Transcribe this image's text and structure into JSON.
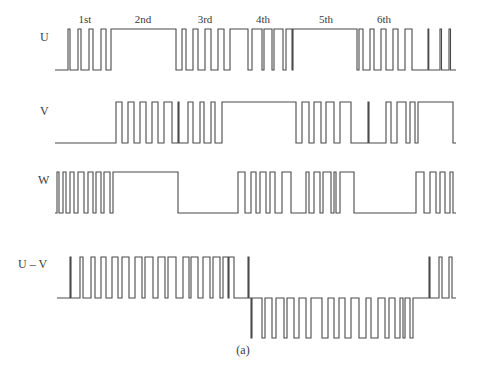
{
  "figure": {
    "caption": "(a)",
    "sectors": [
      {
        "label": "1st",
        "x": 85
      },
      {
        "label": "2nd",
        "x": 143
      },
      {
        "label": "3rd",
        "x": 205
      },
      {
        "label": "4th",
        "x": 263
      },
      {
        "label": "5th",
        "x": 326
      },
      {
        "label": "6th",
        "x": 384
      }
    ],
    "waveforms": [
      {
        "name": "U",
        "label": "U",
        "label_pos": [
          40,
          38
        ],
        "high": 29,
        "low": 70,
        "start": 55,
        "end": 456,
        "initial": "low",
        "edges": [
          68,
          70,
          78,
          81,
          89,
          93,
          101,
          106,
          111,
          176,
          182,
          186,
          193,
          198,
          205,
          211,
          218,
          224,
          230,
          248,
          252,
          262,
          264,
          272,
          274,
          283,
          286,
          292,
          293,
          357,
          359,
          363,
          370,
          374,
          381,
          386,
          393,
          398,
          405,
          412,
          428,
          428.8,
          440,
          441.5,
          449,
          450.5
        ]
      },
      {
        "name": "V",
        "label": "V",
        "label_pos": [
          40,
          112
        ],
        "high": 102,
        "low": 143,
        "start": 55,
        "end": 456,
        "initial": "low",
        "edges": [
          116,
          122,
          128,
          134,
          140,
          146,
          152,
          158,
          164,
          172,
          178,
          179,
          188,
          193,
          200,
          204,
          211,
          215,
          222,
          296,
          302,
          309,
          314,
          321,
          326,
          334,
          340,
          351,
          368,
          369,
          386,
          391,
          397,
          406,
          410,
          415,
          418,
          453
        ]
      },
      {
        "name": "W",
        "label": "W",
        "label_pos": [
          38,
          181
        ],
        "high": 172,
        "low": 213,
        "start": 55,
        "end": 456,
        "initial": "high_pulses",
        "edges": [
          57,
          59,
          63,
          66,
          70,
          74,
          78,
          84,
          88,
          93,
          96,
          101,
          104,
          110,
          113,
          178,
          178,
          178,
          238,
          245,
          251,
          256,
          260,
          266,
          270,
          275,
          282,
          291,
          306,
          309,
          314,
          320,
          323,
          331,
          334,
          336,
          340,
          354,
          355,
          355,
          416,
          424,
          430,
          436,
          440,
          445,
          450,
          453
        ]
      },
      {
        "name": "U-V",
        "label": "U – V",
        "label_pos": [
          18,
          265
        ],
        "zero": 298,
        "high": 257,
        "low": 338,
        "start": 57,
        "end": 456,
        "pos_pulses": [
          [
            70,
            71
          ],
          [
            80,
            83
          ],
          [
            91,
            95
          ],
          [
            101,
            106
          ],
          [
            112,
            118
          ],
          [
            122,
            129
          ],
          [
            135,
            142
          ],
          [
            145,
            153
          ],
          [
            158,
            165
          ],
          [
            168,
            176
          ],
          [
            183,
            189
          ],
          [
            191,
            198
          ],
          [
            203,
            210
          ],
          [
            213,
            220
          ],
          [
            223,
            228
          ],
          [
            229,
            234
          ],
          [
            248,
            249
          ]
        ],
        "neg_pulses": [
          [
            251,
            252
          ],
          [
            262,
            265
          ],
          [
            272,
            276
          ],
          [
            284,
            287
          ],
          [
            294,
            299
          ],
          [
            306,
            311
          ],
          [
            322,
            328
          ],
          [
            334,
            339
          ],
          [
            345,
            351
          ],
          [
            359,
            366
          ],
          [
            371,
            378
          ],
          [
            385,
            389
          ],
          [
            395,
            400
          ],
          [
            403,
            405
          ],
          [
            410,
            413
          ]
        ],
        "tail_pos": [
          [
            429,
            430
          ],
          [
            439,
            442
          ],
          [
            449,
            452
          ]
        ]
      }
    ]
  }
}
